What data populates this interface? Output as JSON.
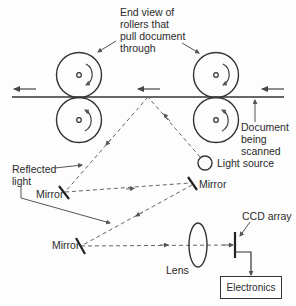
{
  "diagram": {
    "type": "scanner-optical-path",
    "labels": {
      "rollers": [
        "End view of",
        "rollers that",
        "pull document",
        "through"
      ],
      "document": [
        "Document",
        "being",
        "scanned"
      ],
      "light_source": "Light source",
      "reflected_light": [
        "Reflected",
        "light"
      ],
      "mirror_upper_left": "Mirror",
      "mirror_upper_right": "Mirror",
      "mirror_lower": "Mirror",
      "lens": "Lens",
      "ccd_array": "CCD array",
      "electronics": "Electronics"
    },
    "colors": {
      "stroke": "#333333",
      "dashed": "#666666",
      "background": "#fdfdfd"
    }
  }
}
